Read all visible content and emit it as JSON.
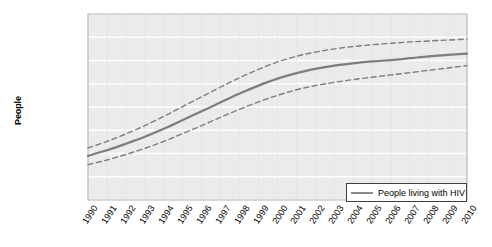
{
  "chart_data": {
    "type": "line",
    "title": "",
    "xlabel": "",
    "ylabel": "People",
    "ylim": [
      0,
      40000000
    ],
    "ytick_labels": [
      "40,000,000",
      "35,000,000",
      "30,000,000",
      "25,000,000",
      "20,000,000",
      "15,000,000",
      "10,000,000",
      "5,000,000",
      "0"
    ],
    "ytick_values": [
      40000000,
      35000000,
      30000000,
      25000000,
      20000000,
      15000000,
      10000000,
      5000000,
      0
    ],
    "grid": true,
    "grid_orientation": "horizontal",
    "legend_position": "bottom-right",
    "x": [
      "1990",
      "1991",
      "1992",
      "1993",
      "1994",
      "1995",
      "1996",
      "1997",
      "1998",
      "1999",
      "2000",
      "2001",
      "2002",
      "2003",
      "2004",
      "2005",
      "2006",
      "2007",
      "2008",
      "2009",
      "2010"
    ],
    "categories": [
      "1990",
      "1991",
      "1992",
      "1993",
      "1994",
      "1995",
      "1996",
      "1997",
      "1998",
      "1999",
      "2000",
      "2001",
      "2002",
      "2003",
      "2004",
      "2005",
      "2006",
      "2007",
      "2008",
      "2009",
      "2010"
    ],
    "series": [
      {
        "name": "People living with HIV",
        "style": "solid",
        "color": "#7d7d7d",
        "values": [
          9500000,
          10700000,
          12100000,
          13600000,
          15300000,
          17200000,
          19100000,
          21000000,
          22900000,
          24600000,
          26100000,
          27300000,
          28200000,
          28900000,
          29400000,
          29800000,
          30100000,
          30500000,
          30900000,
          31200000,
          31500000
        ]
      },
      {
        "name": "Upper bound",
        "style": "dashed",
        "color": "#7d7d7d",
        "values": [
          11200000,
          12600000,
          14200000,
          16000000,
          18000000,
          20100000,
          22200000,
          24300000,
          26300000,
          28100000,
          29700000,
          30900000,
          31800000,
          32500000,
          33000000,
          33400000,
          33700000,
          34000000,
          34200000,
          34400000,
          34600000
        ]
      },
      {
        "name": "Lower bound",
        "style": "dashed",
        "color": "#7d7d7d",
        "values": [
          7600000,
          8600000,
          9800000,
          11100000,
          12600000,
          14300000,
          16000000,
          17800000,
          19500000,
          21100000,
          22500000,
          23700000,
          24600000,
          25300000,
          25900000,
          26400000,
          26900000,
          27400000,
          27900000,
          28400000,
          28900000
        ]
      }
    ],
    "legend": [
      {
        "label": "People living with HIV",
        "color": "#7d7d7d",
        "style": "solid"
      }
    ]
  }
}
